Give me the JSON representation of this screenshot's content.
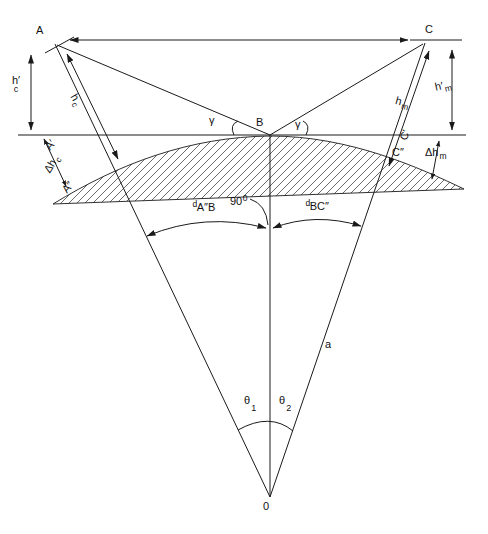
{
  "diagram": {
    "colors": {
      "stroke": "#1a1a1a",
      "background": "#ffffff"
    },
    "points": {
      "A": "A",
      "B": "B",
      "C": "C",
      "origin": "0",
      "A_prime": "A′",
      "A_double_prime": "A″",
      "C_prime": "C′",
      "C_double_prime": "C″"
    },
    "heights": {
      "antenna_left_above_tangent": {
        "main": "h′",
        "sub": "c"
      },
      "antenna_left_above_surface": {
        "main": "h",
        "sub": "c"
      },
      "antenna_right_above_tangent": {
        "main": "h′",
        "sub": "m"
      },
      "antenna_right_above_surface": {
        "main": "h",
        "sub": "m"
      },
      "curvature_drop_left": {
        "main": "Δh",
        "sub": "c"
      },
      "curvature_drop_right": {
        "main": "Δh",
        "sub": "m"
      }
    },
    "angles": {
      "gamma_left": "γ",
      "gamma_right": "γ",
      "right_angle": {
        "main": "90",
        "sup": "0"
      },
      "theta_1": {
        "main": "θ",
        "sub": "1"
      },
      "theta_2": {
        "main": "θ",
        "sub": "2"
      }
    },
    "arc_distances": {
      "left": {
        "sup": "d",
        "main": "A″B"
      },
      "right": {
        "sup": "d",
        "main": "BC″"
      }
    },
    "earth_radius": "a"
  }
}
